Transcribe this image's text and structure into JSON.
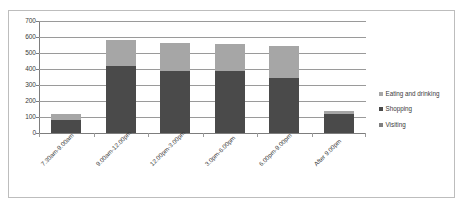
{
  "chart_data": {
    "type": "bar",
    "subtype": "stacked-column",
    "title": "",
    "xlabel": "",
    "ylabel": "",
    "ylim": [
      0,
      700
    ],
    "ytick_step": 100,
    "ytick_labels": [
      "0",
      "100",
      "200",
      "300",
      "400",
      "500",
      "600",
      "700"
    ],
    "grid": true,
    "legend_position": "right",
    "categories": [
      "7.30am-9.00am",
      "9.00am-12.00pm",
      "12.00pm-3.00pm",
      "3.0pm-6.00pm",
      "6.00pm-9.00pm",
      "After 9.00pm"
    ],
    "series": [
      {
        "name": "Visiting",
        "color": "#7f7f7f",
        "values": [
          0,
          0,
          0,
          0,
          0,
          0
        ]
      },
      {
        "name": "Shopping",
        "color": "#4a4a4a",
        "values": [
          80,
          420,
          385,
          390,
          345,
          120
        ]
      },
      {
        "name": "Eating and drinking",
        "color": "#a6a6a6",
        "values": [
          40,
          160,
          180,
          165,
          197,
          17
        ]
      }
    ],
    "totals": [
      120,
      580,
      565,
      555,
      542,
      137
    ]
  },
  "legend": {
    "items": [
      {
        "label": "Eating and drinking",
        "color": "#a6a6a6"
      },
      {
        "label": "Shopping",
        "color": "#4a4a4a"
      },
      {
        "label": "Visiting",
        "color": "#7f7f7f"
      }
    ]
  },
  "colors": {
    "frame_border": "#bdbdbd",
    "gridline": "#9a9a9a",
    "axis": "#7d7d7d",
    "text": "#3a3a3a",
    "background": "#ffffff"
  }
}
